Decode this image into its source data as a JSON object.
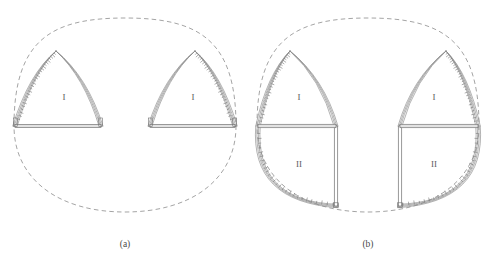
{
  "figure": {
    "background": "#ffffff",
    "line_color": "#8a8a8a",
    "line_color_dark": "#6e6e6e",
    "dash_color": "#9a9a9a",
    "hatch_color": "#777777",
    "label_color": "#5a5a5a"
  },
  "panels": [
    {
      "id": "a",
      "caption": "(a)",
      "caption_x": 125,
      "caption_y": 247,
      "origin_x": 0,
      "description": "Excavation stage one: two upper side heading pointed arches",
      "outline": {
        "type": "dashed-closed-profile",
        "center_x": 125,
        "top_y": 18,
        "bottom_y": 212,
        "left_x": 14,
        "right_x": 236
      },
      "arches": [
        {
          "side": "left",
          "zone_label": "I",
          "zone_label_x": 64,
          "zone_label_y": 100,
          "apex_x": 56,
          "apex_y": 51,
          "base_y": 126,
          "outer_x": 15,
          "inner_x": 101,
          "hatched_edge": "outer-left"
        },
        {
          "side": "right",
          "zone_label": "I",
          "zone_label_x": 193,
          "zone_label_y": 100,
          "apex_x": 195,
          "apex_y": 51,
          "base_y": 126,
          "outer_x": 235,
          "inner_x": 150,
          "hatched_edge": "outer-right"
        }
      ]
    },
    {
      "id": "b",
      "caption": "(b)",
      "caption_x": 368,
      "caption_y": 247,
      "origin_x": 245,
      "description": "Excavation stage two: side headings deepened, lower zones II opened",
      "outline": {
        "type": "dashed-closed-profile",
        "center_x": 368,
        "top_y": 18,
        "bottom_y": 212,
        "left_x": 257,
        "right_x": 479
      },
      "arches": [
        {
          "side": "left",
          "zone_label_upper": "I",
          "zone_label_upper_x": 299,
          "zone_label_upper_y": 100,
          "zone_label_lower": "II",
          "zone_label_lower_x": 299,
          "zone_label_lower_y": 167,
          "apex_x": 290,
          "apex_y": 51,
          "slab_y": 126,
          "bottom_y": 206,
          "outer_x": 258,
          "inner_wall_x": 336,
          "hatched_edge": "outer-left"
        },
        {
          "side": "right",
          "zone_label_upper": "I",
          "zone_label_upper_x": 434,
          "zone_label_upper_y": 100,
          "zone_label_lower": "II",
          "zone_label_lower_x": 434,
          "zone_label_lower_y": 167,
          "apex_x": 446,
          "apex_y": 51,
          "slab_y": 126,
          "bottom_y": 206,
          "outer_x": 478,
          "inner_wall_x": 400,
          "hatched_edge": "outer-right"
        }
      ]
    }
  ]
}
